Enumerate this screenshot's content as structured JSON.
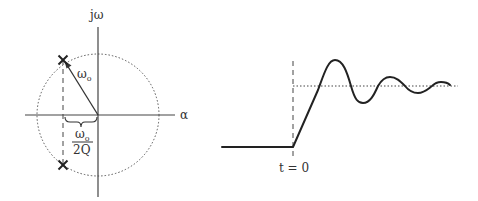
{
  "pole_zero_plot": {
    "imag_axis_label": "jω",
    "real_axis_label": "α",
    "radius_label": "ω",
    "radius_label_sub": "o",
    "distance_label_numerator": "ω",
    "distance_label_numerator_sub": "o",
    "distance_label_denominator": "2Q",
    "pole_marker": "×",
    "pole_count": 2
  },
  "step_response_plot": {
    "time_marker_label": "t = 0"
  },
  "colors": {
    "line": "#333333",
    "background": "#ffffff"
  }
}
